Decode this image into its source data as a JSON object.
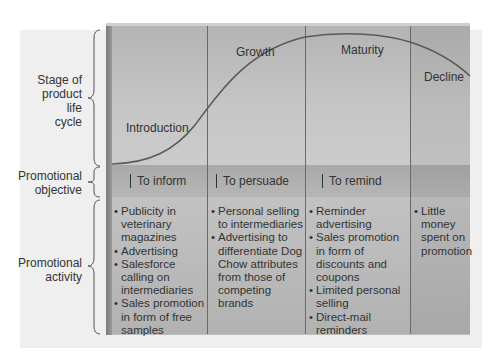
{
  "row_labels": {
    "stage": [
      "Stage of",
      "product",
      "life",
      "cycle"
    ],
    "objective": [
      "Promotional",
      "objective"
    ],
    "activity": [
      "Promotional",
      "activity"
    ]
  },
  "stages": [
    {
      "name": "Introduction",
      "objective": "To inform",
      "activities": [
        "Publicity in veterinary magazines",
        "Advertising",
        "Salesforce calling on intermediaries",
        "Sales promotion in form of free samples"
      ]
    },
    {
      "name": "Growth",
      "objective": "To persuade",
      "activities": [
        "Personal selling to intermediaries",
        "Advertising to differentiate Dog Chow attributes from those of competing brands"
      ]
    },
    {
      "name": "Maturity",
      "objective": "To remind",
      "activities": [
        "Reminder advertising",
        "Sales promotion in form of discounts and coupons",
        "Limited personal selling",
        "Direct-mail reminders"
      ]
    },
    {
      "name": "Decline",
      "objective": "",
      "activities": [
        "Little money spent on promotion"
      ]
    }
  ],
  "colors": {
    "curve": "#5a5a5a",
    "panel": "#bdbdbd",
    "objective_band": "#adadad"
  }
}
